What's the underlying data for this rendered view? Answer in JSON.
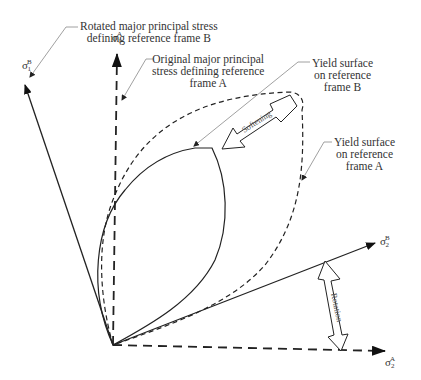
{
  "figure": {
    "type": "diagram"
  },
  "axes": {
    "sigma1_B": {
      "symbol": "σ",
      "sub": "1",
      "sup": "B"
    },
    "sigma1_A": {
      "symbol": "σ",
      "sub": "1",
      "sup": "A"
    },
    "sigma2_B": {
      "symbol": "σ",
      "sub": "2",
      "sup": "B"
    },
    "sigma2_A": {
      "symbol": "σ",
      "sub": "2",
      "sup": "A"
    }
  },
  "labels": {
    "rotated_major": [
      "Rotated major principal stress",
      "defining reference frame B"
    ],
    "original_major": [
      "Original major principal",
      "stress defining reference",
      "frame A"
    ],
    "yield_b": [
      "Yield surface",
      "on reference",
      "frame B"
    ],
    "yield_a": [
      "Yield surface",
      "on reference",
      "frame A"
    ]
  },
  "arrows": {
    "softening": "Softening",
    "rotation": "Rotation"
  },
  "colors": {
    "line": "#222222",
    "leader": "#888888",
    "text": "#333333"
  }
}
